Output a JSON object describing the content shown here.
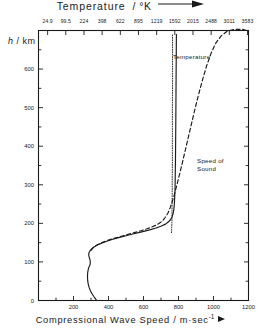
{
  "chart_data": {
    "type": "line",
    "xlabel": "Compressional Wave Speed / m·sec",
    "xlabel_exponent": "-1",
    "ylabel": "h / km",
    "toplabel": "Temperature",
    "topunit": "/ °K",
    "xlim": [
      0,
      1200
    ],
    "ylim": [
      0,
      700
    ],
    "grid": false,
    "legend_position": "inline-annotations",
    "x_ticks": [
      0,
      100,
      200,
      300,
      400,
      500,
      600,
      700,
      800,
      900,
      1000,
      1100,
      1200
    ],
    "x_tick_labels": [
      "",
      "",
      "200",
      "",
      "400",
      "",
      "600",
      "",
      "800",
      "",
      "1000",
      "",
      "1200"
    ],
    "y_ticks": [
      0,
      50,
      100,
      150,
      200,
      250,
      300,
      350,
      400,
      450,
      500,
      550,
      600,
      650,
      700
    ],
    "y_tick_labels": [
      "0",
      "",
      "100",
      "",
      "200",
      "",
      "300",
      "",
      "400",
      "",
      "500",
      "",
      "600",
      "",
      ""
    ],
    "top_axis": {
      "label": "Temperature",
      "unit": "°K",
      "tick_labels": [
        "24.9",
        "99.5",
        "224",
        "398",
        "622",
        "895",
        "1219",
        "1592",
        "2015",
        "2488",
        "3011",
        "3583"
      ],
      "tick_fraction": [
        0.0435,
        0.13,
        0.2165,
        0.303,
        0.3896,
        0.4761,
        0.5626,
        0.6491,
        0.7356,
        0.8221,
        0.9086,
        0.9951
      ]
    },
    "annotations": [
      {
        "text": "Temperature",
        "x_frac": 0.64,
        "y_frac": 0.082
      },
      {
        "text": "Speed of",
        "x_frac": 0.755,
        "y_frac": 0.47
      },
      {
        "text": "Sound",
        "x_frac": 0.755,
        "y_frac": 0.497
      }
    ],
    "series": [
      {
        "name": "Compressional Wave Speed",
        "style": "solid",
        "color": "#1a1a1a",
        "points": [
          [
            332,
            0
          ],
          [
            325,
            5
          ],
          [
            315,
            11
          ],
          [
            305,
            18
          ],
          [
            296,
            26
          ],
          [
            289,
            34
          ],
          [
            284,
            43
          ],
          [
            281,
            52
          ],
          [
            280,
            62
          ],
          [
            281,
            72
          ],
          [
            284,
            80
          ],
          [
            288,
            86
          ],
          [
            292,
            90
          ],
          [
            295,
            94
          ],
          [
            296,
            99
          ],
          [
            295,
            104
          ],
          [
            292,
            109
          ],
          [
            289,
            113
          ],
          [
            287,
            118
          ],
          [
            288,
            123
          ],
          [
            293,
            128
          ],
          [
            302,
            133
          ],
          [
            315,
            138
          ],
          [
            333,
            143
          ],
          [
            357,
            148
          ],
          [
            386,
            153
          ],
          [
            420,
            158
          ],
          [
            458,
            163
          ],
          [
            500,
            168
          ],
          [
            545,
            173
          ],
          [
            590,
            178
          ],
          [
            635,
            183
          ],
          [
            672,
            188
          ],
          [
            703,
            193
          ],
          [
            726,
            198
          ],
          [
            743,
            204
          ],
          [
            755,
            210
          ],
          [
            763,
            217
          ],
          [
            769,
            225
          ],
          [
            773,
            235
          ],
          [
            776,
            248
          ],
          [
            778,
            265
          ],
          [
            780,
            285
          ],
          [
            781,
            310
          ],
          [
            782,
            340
          ],
          [
            783,
            380
          ],
          [
            784,
            430
          ],
          [
            785,
            490
          ],
          [
            786,
            560
          ],
          [
            787,
            630
          ],
          [
            788,
            690
          ]
        ]
      },
      {
        "name": "Speed of Sound",
        "style": "dashed",
        "color": "#1a1a1a",
        "points": [
          [
            300,
            130
          ],
          [
            310,
            136
          ],
          [
            324,
            141
          ],
          [
            343,
            146
          ],
          [
            367,
            151
          ],
          [
            396,
            156
          ],
          [
            430,
            161
          ],
          [
            468,
            166
          ],
          [
            508,
            171
          ],
          [
            548,
            176
          ],
          [
            586,
            181
          ],
          [
            620,
            186
          ],
          [
            650,
            191
          ],
          [
            675,
            196
          ],
          [
            696,
            202
          ],
          [
            713,
            209
          ],
          [
            727,
            217
          ],
          [
            740,
            227
          ],
          [
            752,
            240
          ],
          [
            764,
            256
          ],
          [
            777,
            276
          ],
          [
            791,
            300
          ],
          [
            806,
            327
          ],
          [
            822,
            357
          ],
          [
            839,
            390
          ],
          [
            857,
            425
          ],
          [
            876,
            462
          ],
          [
            896,
            500
          ],
          [
            917,
            538
          ],
          [
            939,
            575
          ],
          [
            962,
            610
          ],
          [
            987,
            642
          ],
          [
            1014,
            668
          ],
          [
            1044,
            686
          ],
          [
            1078,
            698
          ],
          [
            1120,
            703
          ],
          [
            1165,
            703
          ],
          [
            1190,
            700
          ]
        ]
      },
      {
        "name": "Temperature",
        "style": "dotted",
        "color": "#1a1a1a",
        "points": [
          [
            760,
            176
          ],
          [
            761,
            185
          ],
          [
            762,
            198
          ],
          [
            763,
            215
          ],
          [
            763,
            240
          ],
          [
            764,
            270
          ],
          [
            764,
            310
          ],
          [
            765,
            360
          ],
          [
            765,
            420
          ],
          [
            765,
            490
          ],
          [
            766,
            560
          ],
          [
            766,
            630
          ],
          [
            766,
            690
          ]
        ]
      }
    ]
  }
}
